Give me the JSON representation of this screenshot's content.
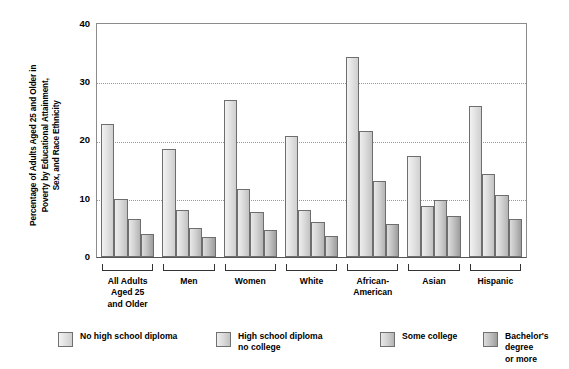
{
  "chart_data": {
    "type": "bar",
    "title": "",
    "xlabel": "",
    "ylabel": "Percentage of Adults Aged 25 and Older in\nPoverty by Educational Attainment,\nSex, and Race Ethnicity",
    "ylim": [
      0,
      40
    ],
    "yticks": [
      "0",
      "10",
      "20",
      "30",
      "40"
    ],
    "grid": true,
    "legend_position": "bottom",
    "categories": [
      "All Adults\nAged 25\nand Older",
      "Men",
      "Women",
      "White",
      "African-\nAmerican",
      "Asian",
      "Hispanic"
    ],
    "series": [
      {
        "name": "No high school diploma",
        "values": [
          22.8,
          18.6,
          27.0,
          20.8,
          34.3,
          17.3,
          26.0
        ]
      },
      {
        "name": "High school diploma\nno college",
        "values": [
          10.0,
          8.0,
          11.6,
          8.1,
          21.7,
          8.8,
          14.2
        ]
      },
      {
        "name": "Some college",
        "values": [
          6.6,
          5.0,
          7.8,
          6.0,
          13.0,
          9.8,
          10.6
        ]
      },
      {
        "name": "Bachelor's degree\nor more",
        "values": [
          4.0,
          3.5,
          4.6,
          3.6,
          5.6,
          7.1,
          6.6
        ]
      }
    ],
    "colors": {
      "series_0": "#e3e3e3",
      "series_1": "#dcdcdc",
      "series_2": "#d4d4d4",
      "series_3": "#c3c3c3",
      "gridline": "#9a9a9a",
      "axis": "#555555",
      "text": "#000000",
      "background": "#ffffff"
    }
  }
}
